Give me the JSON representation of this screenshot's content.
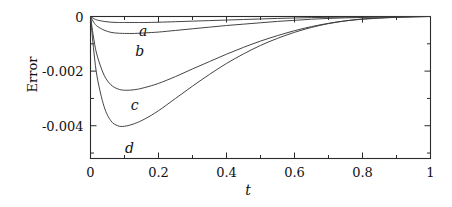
{
  "chart_data": {
    "type": "line",
    "title": "",
    "subtitle": "",
    "xlabel": "t",
    "ylabel": "Error",
    "xlim": [
      0,
      1
    ],
    "ylim": [
      -0.0052,
      0
    ],
    "grid": false,
    "legend_position": "inline-curve-labels",
    "x_ticks": [
      {
        "value": 0,
        "label": "0"
      },
      {
        "value": 0.2,
        "label": "0.2"
      },
      {
        "value": 0.4,
        "label": "0.4"
      },
      {
        "value": 0.6,
        "label": "0.6"
      },
      {
        "value": 0.8,
        "label": "0.8"
      },
      {
        "value": 1,
        "label": "1"
      }
    ],
    "x_minor_ticks": [
      0.1,
      0.3,
      0.5,
      0.7,
      0.9
    ],
    "y_ticks": [
      {
        "value": 0,
        "label": "0"
      },
      {
        "value": -0.002,
        "label": "-0.002"
      },
      {
        "value": -0.004,
        "label": "-0.004"
      }
    ],
    "y_minor_ticks": [
      -0.001,
      -0.003,
      -0.005
    ],
    "line_color": "#3a3a3a",
    "axis_color": "#2b2b2b",
    "series": [
      {
        "name": "a",
        "label": "a",
        "label_x": 0.155,
        "label_y": -0.00052,
        "min_value": -0.00022,
        "min_at_x": 0.16,
        "x": [
          0,
          0.01,
          0.02,
          0.04,
          0.06,
          0.08,
          0.1,
          0.13,
          0.16,
          0.2,
          0.25,
          0.3,
          0.35,
          0.4,
          0.45,
          0.5,
          0.55,
          0.6,
          0.65,
          0.7,
          0.75,
          0.8,
          0.85,
          0.9,
          0.95,
          1
        ],
        "values": [
          0,
          -8e-05,
          -0.00013,
          -0.00018,
          -0.00021,
          -0.00022,
          -0.00022,
          -0.00022,
          -0.00022,
          -0.00021,
          -0.00019,
          -0.00017,
          -0.00015,
          -0.00013,
          -0.00011,
          -9e-05,
          -7e-05,
          -5.5e-05,
          -4e-05,
          -3e-05,
          -2e-05,
          -1.4e-05,
          -1e-05,
          -6e-06,
          -3e-06,
          0
        ]
      },
      {
        "name": "b",
        "label": "b",
        "label_x": 0.145,
        "label_y": -0.00125,
        "min_value": -0.00062,
        "min_at_x": 0.13,
        "x": [
          0,
          0.01,
          0.02,
          0.04,
          0.06,
          0.08,
          0.1,
          0.13,
          0.16,
          0.2,
          0.25,
          0.3,
          0.35,
          0.4,
          0.45,
          0.5,
          0.55,
          0.6,
          0.65,
          0.7,
          0.75,
          0.8,
          0.85,
          0.9,
          0.95,
          1
        ],
        "values": [
          0,
          -0.00022,
          -0.00036,
          -0.0005,
          -0.00058,
          -0.00061,
          -0.00062,
          -0.00062,
          -0.0006,
          -0.00057,
          -0.00051,
          -0.00045,
          -0.00039,
          -0.00033,
          -0.00028,
          -0.00023,
          -0.00018,
          -0.00014,
          -0.0001,
          -7e-05,
          -5e-05,
          -3.5e-05,
          -2e-05,
          -1.2e-05,
          -5e-06,
          0
        ]
      },
      {
        "name": "c",
        "label": "c",
        "label_x": 0.13,
        "label_y": -0.00325,
        "min_value": -0.0027,
        "min_at_x": 0.115,
        "x": [
          0,
          0.01,
          0.02,
          0.04,
          0.06,
          0.08,
          0.1,
          0.13,
          0.16,
          0.2,
          0.25,
          0.3,
          0.35,
          0.4,
          0.45,
          0.5,
          0.55,
          0.6,
          0.65,
          0.7,
          0.75,
          0.8,
          0.85,
          0.9,
          0.95,
          1
        ],
        "values": [
          0,
          -0.00085,
          -0.00145,
          -0.00215,
          -0.0025,
          -0.00265,
          -0.0027,
          -0.00268,
          -0.0026,
          -0.00245,
          -0.0022,
          -0.00192,
          -0.00165,
          -0.00138,
          -0.00113,
          -0.0009,
          -0.0007,
          -0.00052,
          -0.00037,
          -0.00025,
          -0.00016,
          -0.0001,
          -6e-05,
          -3e-05,
          -1e-05,
          0
        ]
      },
      {
        "name": "d",
        "label": "d",
        "label_x": 0.115,
        "label_y": -0.0048,
        "min_value": -0.00402,
        "min_at_x": 0.1,
        "x": [
          0,
          0.01,
          0.02,
          0.04,
          0.06,
          0.08,
          0.1,
          0.13,
          0.16,
          0.2,
          0.25,
          0.3,
          0.35,
          0.4,
          0.45,
          0.5,
          0.55,
          0.6,
          0.65,
          0.7,
          0.75,
          0.8,
          0.85,
          0.9,
          0.95,
          1
        ],
        "values": [
          0,
          -0.0013,
          -0.00225,
          -0.0033,
          -0.00382,
          -0.004,
          -0.00402,
          -0.00392,
          -0.00375,
          -0.00345,
          -0.003,
          -0.00255,
          -0.00212,
          -0.00172,
          -0.00137,
          -0.00106,
          -0.0008,
          -0.00058,
          -0.0004,
          -0.00026,
          -0.00016,
          -9e-05,
          -5e-05,
          -2.5e-05,
          -1e-05,
          0
        ]
      }
    ]
  }
}
